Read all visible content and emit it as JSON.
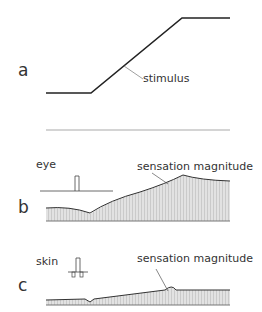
{
  "figure": {
    "panels": [
      {
        "letter": "a",
        "annotation": "stimulus"
      },
      {
        "letter": "b",
        "modality": "eye",
        "annotation": "sensation magnitude"
      },
      {
        "letter": "c",
        "modality": "skin",
        "annotation": "sensation magnitude"
      }
    ],
    "colors": {
      "line": "#222222",
      "fill": "#dcdcdc",
      "hatch": "#bcbcbc",
      "baseline": "#888888"
    }
  }
}
